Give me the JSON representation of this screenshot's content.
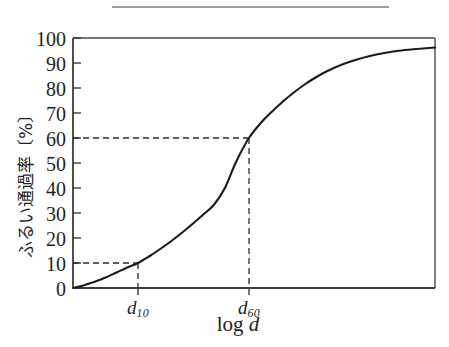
{
  "figure": {
    "top_rule_visible": true,
    "background_color": "#ffffff",
    "ink_color": "#1a1a1a"
  },
  "axes": {
    "y_title": "ふるい通過率〔%〕",
    "x_title_prefix": "log ",
    "x_title_var": "d",
    "y_ticks": [
      "0",
      "10",
      "20",
      "30",
      "40",
      "50",
      "60",
      "70",
      "80",
      "90",
      "100"
    ],
    "x_tick_d10_base": "d",
    "x_tick_d10_sub": "10",
    "x_tick_d60_base": "d",
    "x_tick_d60_sub": "60"
  },
  "chart_data": {
    "type": "line",
    "title": "",
    "subtitle": "",
    "xlabel": "log d",
    "ylabel": "ふるい通過率〔%〕",
    "grid": false,
    "legend": null,
    "xlim": [
      0,
      100
    ],
    "ylim": [
      0,
      100
    ],
    "ytick_values": [
      0,
      10,
      20,
      30,
      40,
      50,
      60,
      70,
      80,
      90,
      100
    ],
    "xtick_values": [
      18,
      48.6
    ],
    "xtick_labels": [
      "d10",
      "d60"
    ],
    "series": [
      {
        "name": "grain size distribution curve",
        "x": [
          0,
          3,
          6,
          9,
          12,
          15,
          18,
          21,
          24,
          27,
          30,
          33,
          36,
          39,
          42,
          45,
          48.6,
          52,
          55,
          58,
          61,
          64,
          67,
          70,
          74,
          78,
          82,
          86,
          90,
          94,
          100
        ],
        "y": [
          0,
          1.1,
          2.5,
          4.2,
          6.2,
          8.2,
          10,
          12.6,
          15.5,
          18.6,
          22,
          25.6,
          29.4,
          33.4,
          40.1,
          50.3,
          60,
          66.2,
          70.6,
          74.6,
          78.2,
          81.4,
          84.2,
          86.6,
          89.2,
          91.2,
          92.8,
          94.0,
          94.9,
          95.5,
          96.2
        ]
      }
    ],
    "annotations": [
      {
        "name": "d10-guide",
        "style": "dashed",
        "point_x": 18,
        "point_y": 10,
        "description": "horizontal dashed line at 10% meeting vertical dashed line down to d10 on x axis"
      },
      {
        "name": "d60-guide",
        "style": "dashed",
        "point_x": 48.6,
        "point_y": 60,
        "description": "horizontal dashed line at 60% meeting vertical dashed line down to d60 on x axis"
      }
    ]
  }
}
